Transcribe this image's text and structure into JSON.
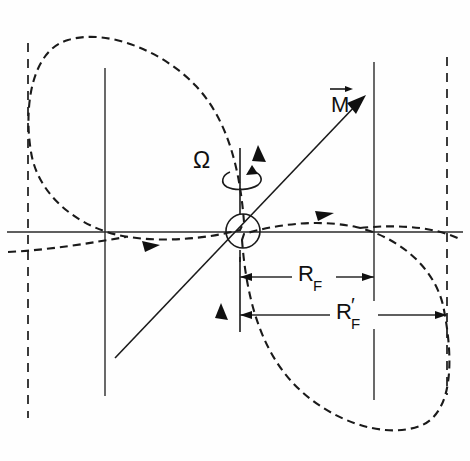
{
  "figure": {
    "background_color": "#fefefe",
    "line_color": "#1a1a1a",
    "width": 470,
    "height": 461
  },
  "labels": {
    "magnetization_vector": "M",
    "magnetization_accent": "→",
    "angular_velocity": "Ω",
    "radius_fermi": "R",
    "radius_fermi_sub": "F",
    "radius_fermi_prime": "R",
    "radius_fermi_prime_mark": "′",
    "radius_fermi_prime_sub": "F"
  },
  "elements": {
    "center_circle": {
      "name": "origin-circle",
      "cx": 243,
      "cy": 231,
      "r": 17
    },
    "horizontal_axis": {
      "x1": 7,
      "y1": 232,
      "x2": 463,
      "y2": 232
    },
    "vertical_axis_left": {
      "x": 105,
      "y1": 68,
      "y2": 396
    },
    "vertical_axis_right": {
      "x": 374,
      "y1": 62,
      "y2": 400
    },
    "dashed_guide_left": {
      "x": 28,
      "y1": 43,
      "y2": 418
    },
    "dashed_guide_right": {
      "x": 447,
      "y1": 57,
      "y2": 395
    },
    "rotation_axis": {
      "x": 240,
      "y1": 120,
      "y2": 335
    },
    "m_axis_line": {
      "x1": 115,
      "y1": 358,
      "x2": 363,
      "y2": 98
    },
    "upper_lobe": {
      "description": "dashed closed loop upper-left tangent to left guide"
    },
    "lower_lobe": {
      "description": "dashed closed loop lower-right tangent to right guide"
    }
  },
  "dimensions": {
    "r_f": {
      "from_x": 240,
      "to_x": 374,
      "y": 277
    },
    "r_f_prime": {
      "from_x": 240,
      "to_x": 447,
      "y": 315
    },
    "witness_line": {
      "x": 240,
      "y1": 257,
      "y2": 332
    }
  },
  "arrow_markers": [
    {
      "name": "upper-lobe-flow-arrow",
      "x": 259,
      "y": 152,
      "direction": "up"
    },
    {
      "name": "lower-left-flow-arrow",
      "x": 148,
      "y": 247,
      "direction": "right"
    },
    {
      "name": "upper-right-flow-arrow",
      "x": 322,
      "y": 215,
      "direction": "right"
    },
    {
      "name": "lower-lobe-flow-arrow",
      "x": 222,
      "y": 312,
      "direction": "up"
    },
    {
      "name": "magnetization-arrowhead",
      "x": 363,
      "y": 98,
      "direction": "up-right"
    },
    {
      "name": "rotation-spin-arrow",
      "x": 252,
      "y": 183,
      "direction": "curved"
    }
  ]
}
